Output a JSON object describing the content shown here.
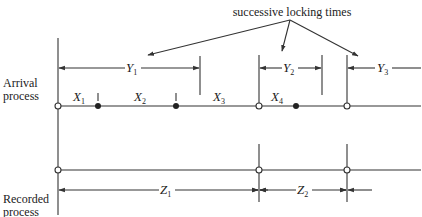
{
  "title_annotation": "successive locking times",
  "axes": {
    "arrival_label_line1": "Arrival",
    "arrival_label_line2": "process",
    "recorded_label_line1": "Recorded",
    "recorded_label_line2": "process"
  },
  "intervals": {
    "X": [
      {
        "name": "X",
        "sub": "1"
      },
      {
        "name": "X",
        "sub": "2"
      },
      {
        "name": "X",
        "sub": "3"
      },
      {
        "name": "X",
        "sub": "4"
      }
    ],
    "Y": [
      {
        "name": "Y",
        "sub": "1"
      },
      {
        "name": "Y",
        "sub": "2"
      },
      {
        "name": "Y",
        "sub": "3"
      }
    ],
    "Z": [
      {
        "name": "Z",
        "sub": "1"
      },
      {
        "name": "Z",
        "sub": "2"
      }
    ]
  },
  "colors": {
    "ink": "#333333",
    "background": "#ffffff"
  }
}
